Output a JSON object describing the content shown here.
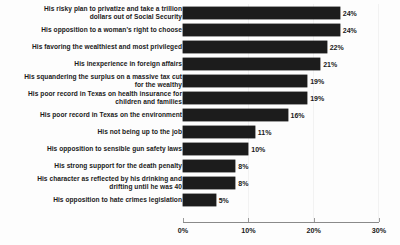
{
  "chart_data": {
    "type": "bar",
    "orientation": "horizontal",
    "title": "",
    "xlabel": "",
    "ylabel": "",
    "xlim": [
      0,
      30
    ],
    "xticks": [
      "0%",
      "10%",
      "20%",
      "30%"
    ],
    "xtick_values": [
      0,
      10,
      20,
      30
    ],
    "grid": false,
    "legend": "none",
    "value_suffix": "%",
    "bar_color": "#1c1c1c",
    "categories": [
      "His risky plan to privatize and take a trillion\ndollars out of Social Security",
      "His opposition to a woman's right to choose",
      "His favoring the wealthiest and most privileged",
      "His inexperience in foreign affairs",
      "His squandering the surplus on a massive tax cut\nfor the wealthy",
      "His poor record in Texas on health insurance for\nchildren and families",
      "His poor record in Texas on the environment",
      "His not being up to the job",
      "His opposition to sensible gun safety laws",
      "His strong support for the death penalty",
      "His character as reflected by his drinking and\ndrifting until he was 40",
      "His opposition to hate crimes legislation"
    ],
    "values": [
      24,
      24,
      22,
      21,
      19,
      19,
      16,
      11,
      10,
      8,
      8,
      5
    ],
    "value_labels": [
      "24%",
      "24%",
      "22%",
      "21%",
      "19%",
      "19%",
      "16%",
      "11%",
      "10%",
      "8%",
      "8%",
      "5%"
    ]
  }
}
